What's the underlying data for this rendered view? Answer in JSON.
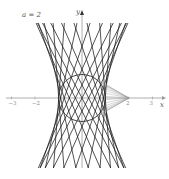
{
  "figure": {
    "parameter_label": "a = 2",
    "x_axis_label": "x",
    "y_axis_label": "y",
    "x_tick_labels": [
      "−3",
      "−2",
      "2",
      "3"
    ],
    "x_tick_values": [
      -3,
      -2,
      2,
      3
    ],
    "colors": {
      "lines": "#1a1a1a",
      "fan": "#9a9a9a",
      "axis": "#9a9a9a",
      "circle": "#333333",
      "label": "#555555"
    }
  },
  "geometry": {
    "origin_px": [
      82,
      98
    ],
    "unit_px": 23.5,
    "y_top_px": 23,
    "y_bottom_px": 168,
    "hyperbola_b": 1.9,
    "ruling_count": 22,
    "circle_center": [
      0,
      0
    ],
    "circle_radius": 1,
    "fan_apex": [
      2,
      0
    ],
    "fan_count": 16
  }
}
